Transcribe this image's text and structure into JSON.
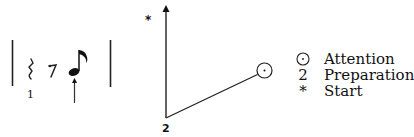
{
  "notation": {
    "count_label": "1",
    "symbols": [
      "quarter-rest",
      "eighth-rest",
      "eighth-note"
    ],
    "arrow_under": "eighth-note"
  },
  "graph": {
    "axis_top_label": "*",
    "axis_bottom_label": "2",
    "end_marker": "attention-circle"
  },
  "legend": {
    "items": [
      {
        "symbol": "⊙",
        "label": "Attention"
      },
      {
        "symbol": "2",
        "label": "Preparation"
      },
      {
        "symbol": "*",
        "label": "Start"
      }
    ]
  }
}
